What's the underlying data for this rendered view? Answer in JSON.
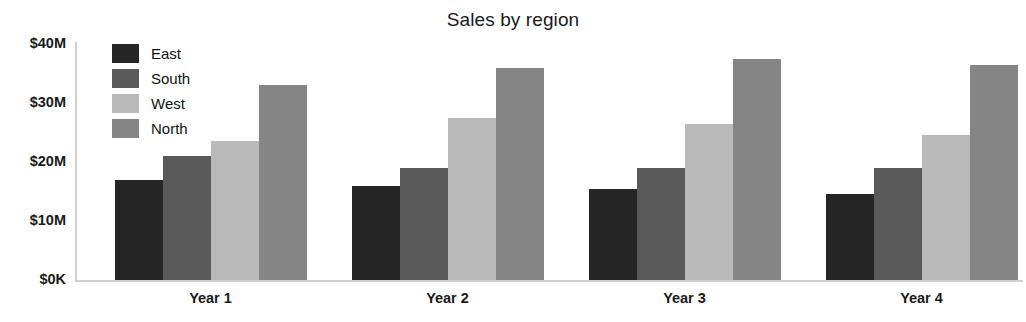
{
  "chart_data": {
    "type": "bar",
    "title": "Sales by region",
    "xlabel": "",
    "ylabel": "",
    "categories": [
      "Year 1",
      "Year 2",
      "Year 3",
      "Year 4"
    ],
    "series": [
      {
        "name": "East",
        "color": "#262626",
        "values": [
          17.0,
          16.0,
          15.5,
          14.5
        ]
      },
      {
        "name": "South",
        "color": "#5a5a5a",
        "values": [
          21.0,
          19.0,
          19.0,
          19.0
        ]
      },
      {
        "name": "West",
        "color": "#b9b9b9",
        "values": [
          23.5,
          27.5,
          26.5,
          24.5
        ]
      },
      {
        "name": "North",
        "color": "#858585",
        "values": [
          33.0,
          36.0,
          37.5,
          36.5
        ]
      }
    ],
    "ylim": [
      0,
      40
    ],
    "ytick_values": [
      0,
      10,
      20,
      30,
      40
    ],
    "ytick_labels": [
      "$0K",
      "$10M",
      "$20M",
      "$30M",
      "$40M"
    ],
    "grid": false,
    "legend_position": "top-left-inside",
    "units": "millions of dollars",
    "axis_color": "#cfcfcf",
    "text_color": "#1a1a1a",
    "background": "#ffffff"
  }
}
